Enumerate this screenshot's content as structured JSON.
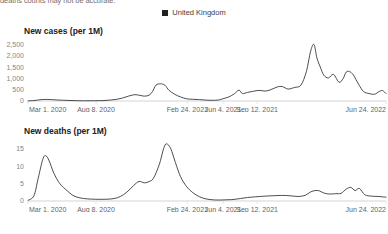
{
  "note": "deaths counts may not be accurate.",
  "legend": {
    "items": [
      {
        "label": "United Kingdom",
        "color": "#202124",
        "marker": "square-marker-icon"
      }
    ]
  },
  "chart_data": [
    {
      "type": "line",
      "title": "New cases (per 1M)",
      "xlabel": "",
      "ylabel": "",
      "ylim": [
        0,
        2700
      ],
      "yticks": [
        0,
        500,
        1000,
        1500,
        2000,
        2500
      ],
      "yticklabels": [
        "0",
        "500",
        "1,000",
        "1,500",
        "2,000",
        "2,500"
      ],
      "grid": false,
      "legend_position": "top-center",
      "series": [
        {
          "name": "United Kingdom",
          "color": "#202124",
          "x": [
            "2020-03-01",
            "2020-03-15",
            "2020-04-01",
            "2020-04-15",
            "2020-05-01",
            "2020-05-15",
            "2020-06-01",
            "2020-06-15",
            "2020-07-01",
            "2020-07-15",
            "2020-08-08",
            "2020-08-25",
            "2020-09-10",
            "2020-09-25",
            "2020-10-10",
            "2020-10-25",
            "2020-11-08",
            "2020-11-20",
            "2020-12-01",
            "2020-12-12",
            "2020-12-20",
            "2020-12-28",
            "2021-01-08",
            "2021-01-18",
            "2021-01-28",
            "2021-02-10",
            "2021-02-24",
            "2021-03-10",
            "2021-03-25",
            "2021-04-10",
            "2021-04-25",
            "2021-05-10",
            "2021-05-25",
            "2021-06-04",
            "2021-06-18",
            "2021-07-01",
            "2021-07-12",
            "2021-07-20",
            "2021-08-01",
            "2021-08-15",
            "2021-08-28",
            "2021-09-12",
            "2021-09-25",
            "2021-10-10",
            "2021-10-22",
            "2021-11-05",
            "2021-11-20",
            "2021-12-05",
            "2021-12-18",
            "2021-12-28",
            "2022-01-05",
            "2022-01-12",
            "2022-01-20",
            "2022-01-28",
            "2022-02-08",
            "2022-02-20",
            "2022-03-05",
            "2022-03-15",
            "2022-03-22",
            "2022-03-30",
            "2022-04-08",
            "2022-04-20",
            "2022-05-02",
            "2022-05-15",
            "2022-05-28",
            "2022-06-08",
            "2022-06-16",
            "2022-06-24"
          ],
          "values": [
            5,
            20,
            60,
            70,
            55,
            40,
            28,
            18,
            12,
            10,
            14,
            18,
            40,
            70,
            130,
            220,
            280,
            250,
            215,
            260,
            420,
            700,
            760,
            700,
            470,
            300,
            180,
            100,
            75,
            60,
            40,
            30,
            45,
            100,
            180,
            320,
            480,
            330,
            380,
            430,
            470,
            440,
            500,
            620,
            640,
            530,
            600,
            700,
            1300,
            2200,
            2500,
            1900,
            1500,
            1150,
            1020,
            1180,
            830,
            1000,
            1280,
            1300,
            1150,
            750,
            420,
            330,
            300,
            420,
            460,
            330
          ]
        }
      ]
    },
    {
      "type": "line",
      "title": "New deaths (per 1M)",
      "xlabel": "",
      "ylabel": "",
      "ylim": [
        0,
        17.5
      ],
      "yticks": [
        0,
        5,
        10,
        15
      ],
      "yticklabels": [
        "0",
        "5",
        "10",
        "15"
      ],
      "grid": false,
      "legend_position": "top-center",
      "series": [
        {
          "name": "United Kingdom",
          "color": "#202124",
          "x": [
            "2020-03-01",
            "2020-03-15",
            "2020-03-25",
            "2020-04-05",
            "2020-04-12",
            "2020-04-20",
            "2020-05-01",
            "2020-05-15",
            "2020-06-01",
            "2020-06-15",
            "2020-07-01",
            "2020-07-20",
            "2020-08-08",
            "2020-09-01",
            "2020-09-20",
            "2020-10-05",
            "2020-10-20",
            "2020-11-05",
            "2020-11-18",
            "2020-12-01",
            "2020-12-12",
            "2020-12-22",
            "2021-01-05",
            "2021-01-15",
            "2021-01-22",
            "2021-02-01",
            "2021-02-12",
            "2021-02-24",
            "2021-03-10",
            "2021-03-25",
            "2021-04-10",
            "2021-04-25",
            "2021-05-15",
            "2021-06-04",
            "2021-06-25",
            "2021-07-15",
            "2021-08-01",
            "2021-08-20",
            "2021-09-12",
            "2021-09-30",
            "2021-10-20",
            "2021-11-10",
            "2021-11-28",
            "2021-12-15",
            "2021-12-28",
            "2022-01-08",
            "2022-01-18",
            "2022-01-28",
            "2022-02-10",
            "2022-02-25",
            "2022-03-10",
            "2022-03-22",
            "2022-04-02",
            "2022-04-12",
            "2022-04-22",
            "2022-05-05",
            "2022-05-20",
            "2022-06-05",
            "2022-06-24"
          ],
          "values": [
            0.2,
            1.5,
            6.5,
            12.0,
            13.0,
            11.5,
            8.0,
            5.0,
            3.0,
            1.6,
            0.9,
            0.6,
            0.5,
            0.5,
            0.7,
            1.3,
            2.5,
            4.4,
            5.6,
            5.2,
            5.6,
            6.5,
            10.5,
            15.0,
            16.4,
            15.0,
            11.0,
            7.0,
            4.2,
            2.4,
            1.2,
            0.6,
            0.3,
            0.3,
            0.4,
            0.7,
            1.0,
            1.2,
            1.4,
            1.5,
            1.6,
            1.5,
            1.3,
            1.6,
            2.6,
            3.0,
            2.9,
            2.3,
            2.0,
            2.1,
            2.2,
            3.4,
            3.9,
            3.0,
            3.6,
            1.8,
            1.4,
            1.3,
            1.1
          ]
        }
      ]
    }
  ],
  "xaxis": {
    "ticklabels": [
      "Mar 1, 2020",
      "Aug 8, 2020",
      "Feb 24, 2021",
      "Jun 4, 2021",
      "Sep 12, 2021",
      "Jun 24, 2022"
    ],
    "tickpositions": [
      0.0,
      0.19,
      0.445,
      0.545,
      0.64,
      1.0
    ]
  }
}
